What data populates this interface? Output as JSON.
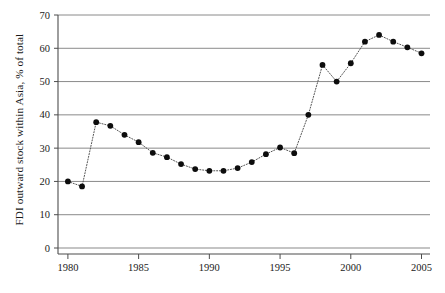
{
  "chart_data": {
    "type": "line",
    "title": "",
    "xlabel": "",
    "ylabel": "FDI outward stock within Asia, % of total",
    "x": [
      1980,
      1981,
      1982,
      1983,
      1984,
      1985,
      1986,
      1987,
      1988,
      1989,
      1990,
      1991,
      1992,
      1993,
      1994,
      1995,
      1996,
      1997,
      1998,
      1999,
      2000,
      2001,
      2002,
      2003,
      2004,
      2005
    ],
    "values": [
      20.0,
      18.5,
      37.8,
      36.7,
      34.0,
      31.8,
      28.6,
      27.3,
      25.2,
      23.7,
      23.2,
      23.2,
      24.0,
      25.8,
      28.2,
      30.2,
      28.5,
      40.0,
      55.0,
      50.0,
      55.5,
      62.0,
      64.0,
      62.0,
      60.3,
      58.5
    ],
    "series": [
      {
        "name": "FDI outward stock within Asia",
        "values": [
          20.0,
          18.5,
          37.8,
          36.7,
          34.0,
          31.8,
          28.6,
          27.3,
          25.2,
          23.7,
          23.2,
          23.2,
          24.0,
          25.8,
          28.2,
          30.2,
          28.5,
          40.0,
          55.0,
          50.0,
          55.5,
          62.0,
          64.0,
          62.0,
          60.3,
          58.5
        ]
      }
    ],
    "xlim": [
      1979.3,
      2005.6
    ],
    "ylim": [
      0,
      70
    ],
    "yticks": [
      0,
      10,
      20,
      30,
      40,
      50,
      60,
      70
    ],
    "ytick_labels": [
      "0",
      "10",
      "20",
      "30",
      "40",
      "50",
      "60",
      "70"
    ],
    "xticks": [
      1980,
      1985,
      1990,
      1995,
      2000,
      2005
    ],
    "xtick_labels": [
      "1980",
      "1985",
      "1990",
      "1995",
      "2000",
      "2005"
    ],
    "grid": "horizontal",
    "legend": "none",
    "line_style": "dotted",
    "marker": "filled-circle",
    "colors": {
      "line": "#555555",
      "marker": "#0d0d0d",
      "grid": "#8a8a8a",
      "axis": "#4d4d4d",
      "text": "#1a1a1a",
      "background": "#ffffff"
    }
  },
  "caption": {
    "cropped_text": ""
  }
}
